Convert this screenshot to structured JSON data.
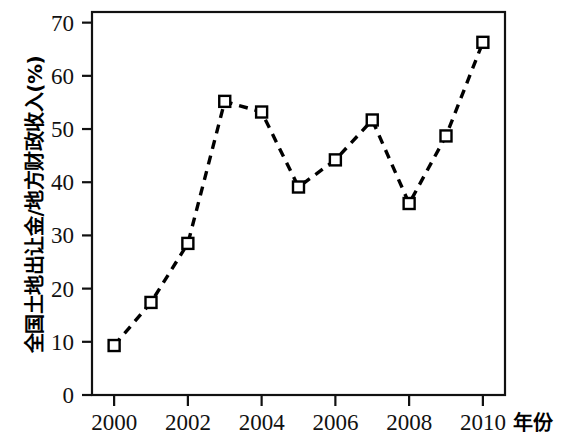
{
  "chart_data": {
    "type": "line",
    "title": "",
    "subtitle": "",
    "xlabel": "年份",
    "ylabel": "全国土地出让金/地方财政收入(%)",
    "x": [
      2000,
      2001,
      2002,
      2003,
      2004,
      2005,
      2006,
      2007,
      2008,
      2009,
      2010
    ],
    "values": [
      9.3,
      17.4,
      28.5,
      55.2,
      53.2,
      39.1,
      44.2,
      51.7,
      36.0,
      48.7,
      66.3
    ],
    "series": [
      {
        "name": "全国土地出让金/地方财政收入(%)",
        "values": [
          9.3,
          17.4,
          28.5,
          55.2,
          53.2,
          39.1,
          44.2,
          51.7,
          36.0,
          48.7,
          66.3
        ]
      }
    ],
    "xlim": [
      1999.4,
      2010.6
    ],
    "ylim": [
      0,
      72
    ],
    "xticks": [
      2000,
      2002,
      2004,
      2006,
      2008,
      2010
    ],
    "xticklabels": [
      "2000",
      "2002",
      "2004",
      "2006",
      "2008",
      "2010"
    ],
    "yticks": [
      0,
      10,
      20,
      30,
      40,
      50,
      60,
      70
    ],
    "yticklabels": [
      "0",
      "10",
      "20",
      "30",
      "40",
      "50",
      "60",
      "70"
    ],
    "grid": false,
    "legend": null,
    "line_style": "dashed",
    "marker": "square-open",
    "line_color": "#000000",
    "marker_face_color": "#ffffff",
    "marker_edge_color": "#000000"
  },
  "axes": {
    "y_axis_title": "全国土地出让金/地方财政收入(%)",
    "x_axis_title": "年份"
  }
}
